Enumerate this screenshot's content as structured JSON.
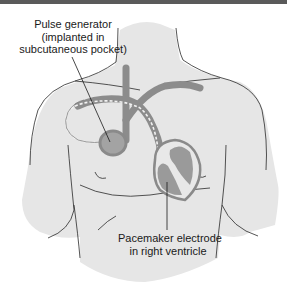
{
  "figure": {
    "colors": {
      "skin": "#e6e6e6",
      "outline": "#2a2a2a",
      "vessel": "#8c8c8c",
      "device": "#a3a3a3",
      "heart_chamber": "#9a9a9a",
      "top_bar": "#5a5a5a"
    },
    "labels": {
      "pulse_generator": {
        "line1": "Pulse generator",
        "line2": "(implanted in",
        "line3": "subcutaneous pocket)"
      },
      "electrode": {
        "line1": "Pacemaker electrode",
        "line2": "in right ventricle"
      }
    }
  }
}
